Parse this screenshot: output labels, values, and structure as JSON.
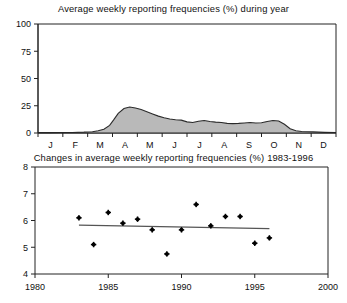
{
  "figure": {
    "width": 347,
    "height": 303,
    "background": "#ffffff",
    "ink_color": "#222222",
    "area_fill_color": "#b9b9b9",
    "trend_line_color": "#555555",
    "marker_color": "#000000"
  },
  "chart_data": [
    {
      "type": "area",
      "title": "Average weekly reporting frequencies (%) during year",
      "xlabel": "",
      "ylabel": "",
      "grid": false,
      "legend": "none",
      "ylim": [
        0,
        100
      ],
      "yticks": [
        0,
        25,
        50,
        75,
        100
      ],
      "ytick_labels": [
        "0",
        "25",
        "50",
        "75",
        "100"
      ],
      "categories": [
        "J",
        "F",
        "M",
        "A",
        "M",
        "J",
        "J",
        "A",
        "S",
        "O",
        "N",
        "D"
      ],
      "xtick_labels": [
        "J",
        "F",
        "M",
        "A",
        "M",
        "J",
        "J",
        "A",
        "S",
        "O",
        "N",
        "D"
      ],
      "x_note": "weeks of the year, 12 monthly tick intervals",
      "x": [
        0,
        2,
        4,
        6,
        8,
        9.5,
        10.5,
        11.5,
        12.5,
        13.2,
        14,
        15,
        16,
        17,
        18,
        19,
        20,
        21,
        22,
        23,
        24,
        25,
        26,
        27,
        28,
        29,
        30,
        31,
        32,
        33,
        34,
        35,
        36,
        37,
        38,
        39,
        40,
        41,
        42,
        43,
        44,
        45,
        46,
        48,
        50,
        52
      ],
      "values": [
        0.3,
        0.3,
        0.4,
        0.5,
        0.8,
        1.2,
        2.0,
        3.5,
        7.0,
        12.0,
        18.0,
        22.5,
        23.8,
        23.0,
        21.5,
        19.5,
        17.5,
        15.5,
        14.0,
        12.8,
        12.2,
        11.8,
        10.2,
        9.6,
        10.8,
        11.4,
        10.6,
        10.0,
        9.6,
        8.8,
        8.6,
        8.8,
        9.2,
        9.6,
        9.2,
        9.4,
        10.6,
        11.4,
        11.0,
        8.0,
        4.0,
        2.0,
        1.4,
        1.0,
        0.6,
        0.4
      ],
      "peak": {
        "label": "late April / May peak",
        "value": 23.8
      },
      "series": [
        {
          "name": "Average weekly reporting frequency (%)",
          "values": [
            0.3,
            0.3,
            0.4,
            0.5,
            0.8,
            1.2,
            2.0,
            3.5,
            7.0,
            12.0,
            18.0,
            22.5,
            23.8,
            23.0,
            21.5,
            19.5,
            17.5,
            15.5,
            14.0,
            12.8,
            12.2,
            11.8,
            10.2,
            9.6,
            10.8,
            11.4,
            10.6,
            10.0,
            9.6,
            8.8,
            8.6,
            8.8,
            9.2,
            9.6,
            9.2,
            9.4,
            10.6,
            11.4,
            11.0,
            8.0,
            4.0,
            2.0,
            1.4,
            1.0,
            0.6,
            0.4
          ]
        }
      ]
    },
    {
      "type": "scatter",
      "title": "Changes in average weekly reporting frequencies (%) 1983-1996",
      "xlabel": "",
      "ylabel": "",
      "grid": false,
      "legend": "none",
      "xlim": [
        1980,
        2000
      ],
      "ylim": [
        4,
        8
      ],
      "xticks": [
        1980,
        1985,
        1990,
        1995,
        2000
      ],
      "xtick_labels": [
        "1980",
        "1985",
        "1990",
        "1995",
        "2000"
      ],
      "yticks": [
        4,
        5,
        6,
        7,
        8
      ],
      "ytick_labels": [
        "4",
        "5",
        "6",
        "7",
        "8"
      ],
      "x": [
        1983,
        1984,
        1985,
        1986,
        1987,
        1988,
        1989,
        1990,
        1991,
        1992,
        1993,
        1994,
        1995,
        1996
      ],
      "values": [
        6.1,
        5.1,
        6.3,
        5.9,
        6.05,
        5.65,
        4.75,
        5.65,
        6.6,
        5.8,
        6.15,
        6.15,
        5.15,
        5.35
      ],
      "series": [
        {
          "name": "Annual average weekly reporting frequency (%)",
          "x": [
            1983,
            1984,
            1985,
            1986,
            1987,
            1988,
            1989,
            1990,
            1991,
            1992,
            1993,
            1994,
            1995,
            1996
          ],
          "values": [
            6.1,
            5.1,
            6.3,
            5.9,
            6.05,
            5.65,
            4.75,
            5.65,
            6.6,
            5.8,
            6.15,
            6.15,
            5.15,
            5.35
          ]
        },
        {
          "name": "Linear trend",
          "type": "line",
          "x": [
            1983,
            1996
          ],
          "values": [
            5.83,
            5.7
          ]
        }
      ]
    }
  ]
}
